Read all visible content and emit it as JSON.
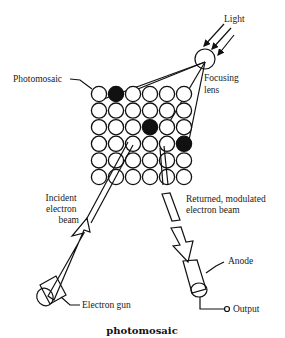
{
  "labels": {
    "light": "Light",
    "photomosaic": "Photomosaic",
    "focusing_lens": [
      "Focusing",
      "lens"
    ],
    "incident_beam": [
      "Incident",
      "electron",
      "beam"
    ],
    "returned_beam": [
      "Returned, modulated",
      "electron beam"
    ],
    "anode": "Anode",
    "electron_gun": "Electron gun",
    "output": "Output"
  },
  "caption": "photomosaic",
  "mosaic": {
    "rows": 6,
    "cols": 6,
    "filled_cells": [
      [
        0,
        1
      ],
      [
        2,
        3
      ],
      [
        3,
        5
      ]
    ]
  },
  "colors": {
    "ink": "#111111",
    "background": "#ffffff"
  }
}
